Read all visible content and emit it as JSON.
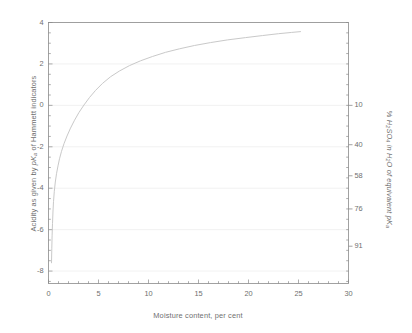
{
  "chart_data": {
    "type": "line",
    "title": "",
    "xlabel": "Moisture content, per cent",
    "ylabel_left": "Acidity as given by pKa of Hammett indicators",
    "ylabel_right": "% H2SO4 in H2O of equivalent pKa",
    "xlim": [
      0,
      30
    ],
    "ylim": [
      -8.6,
      4
    ],
    "grid": true,
    "legend": null,
    "x_ticks": [
      0,
      5,
      10,
      15,
      20,
      25,
      30
    ],
    "x_tick_labels": [
      "0",
      "5",
      "10",
      "15",
      "20",
      "25",
      "30"
    ],
    "x_minor_step": 1,
    "y_ticks": [
      4,
      2,
      0,
      -2,
      -4,
      -6,
      -8
    ],
    "y_tick_labels": [
      "4",
      "2",
      "0",
      "-2",
      "-4",
      "-6",
      "-8"
    ],
    "y_minor_step": 0.5,
    "right_axis": {
      "values": [
        10,
        40,
        58,
        76,
        91
      ],
      "labels": [
        "10",
        "40",
        "58",
        "76",
        "91"
      ],
      "at_left_y": [
        0.0,
        -1.9,
        -3.4,
        -5.0,
        -6.8
      ]
    },
    "series": [
      {
        "name": "acidity vs moisture",
        "color": "#c9c9c9",
        "x": [
          0.3,
          0.33,
          0.36,
          0.4,
          0.45,
          0.5,
          0.58,
          0.68,
          0.8,
          0.95,
          1.1,
          1.3,
          1.55,
          1.85,
          2.2,
          2.6,
          3.05,
          3.55,
          4.1,
          4.7,
          5.4,
          6.2,
          7.1,
          8.1,
          9.2,
          10.4,
          11.7,
          13.1,
          14.6,
          16.2,
          17.9,
          19.7,
          21.4,
          23.0,
          24.3,
          25.2
        ],
        "y": [
          -7.6,
          -6.9,
          -6.3,
          -5.7,
          -5.1,
          -4.65,
          -4.15,
          -3.7,
          -3.3,
          -2.92,
          -2.58,
          -2.22,
          -1.85,
          -1.48,
          -1.1,
          -0.72,
          -0.34,
          0.02,
          0.38,
          0.72,
          1.06,
          1.38,
          1.66,
          1.92,
          2.15,
          2.36,
          2.56,
          2.73,
          2.89,
          3.03,
          3.16,
          3.27,
          3.37,
          3.46,
          3.52,
          3.56
        ]
      }
    ]
  },
  "colors": {
    "axis": "#8a8a8a",
    "grid": "#ededed",
    "curve": "#c9c9c9",
    "text": "#6f6f6f",
    "background": "#ffffff"
  }
}
